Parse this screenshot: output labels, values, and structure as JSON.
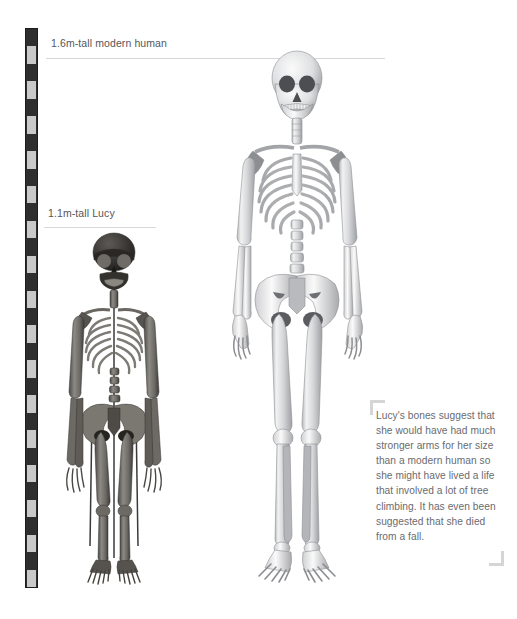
{
  "page": {
    "background_color": "#ffffff",
    "width": 517,
    "height": 619
  },
  "scale_ruler": {
    "name": "measuring-scale-bar",
    "orientation": "vertical",
    "segment_count": 32,
    "dark_color": "#2e2e2e",
    "light_color": "#c9c9c9"
  },
  "labels": [
    {
      "id": "human",
      "text": "1.6m-tall modern human",
      "height_meters": 1.6,
      "subject": "modern human",
      "rule_color": "#d8d8d8"
    },
    {
      "id": "lucy",
      "text": "1.1m-tall Lucy",
      "height_meters": 1.1,
      "subject": "Lucy",
      "rule_color": "#d8d8d8"
    }
  ],
  "figures": [
    {
      "id": "human",
      "name": "modern-human-skeleton",
      "alt": "Full anterior view of a modern human skeleton, light grey bone"
    },
    {
      "id": "lucy",
      "name": "lucy-skeleton",
      "alt": "Reconstructed Australopithecus afarensis skeleton known as Lucy, dark fossil bone on a mounting armature"
    }
  ],
  "caption": {
    "name": "lucy-caption",
    "text": "Lucy's bones suggest that she would have had much stronger arms for her size than a modern human so she might have lived a life that involved a lot of tree climbing. It has even been suggested that she died from a fall.",
    "text_color": "#6a6b70",
    "bracket_color": "#d5d5d5"
  }
}
